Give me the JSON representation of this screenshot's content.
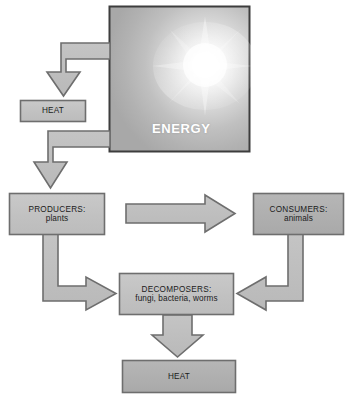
{
  "diagram": {
    "background_color": "#ffffff",
    "stroke_color": "#6b6b6b",
    "box_fill_light": "#c2c2c2",
    "box_fill_dark": "#b0b0b0",
    "arrow_fill": "#bebebe",
    "energy_text_color": "#ffffff"
  },
  "nodes": {
    "energy": {
      "label": "ENERGY",
      "fill": "radial-gradient-sun",
      "x": 109,
      "y": 6,
      "w": 141,
      "h": 146
    },
    "heat_top": {
      "label": "HEAT",
      "x": 20,
      "y": 100,
      "w": 66,
      "h": 22
    },
    "producers": {
      "label": "PRODUCERS:",
      "sublabel": "plants",
      "x": 9,
      "y": 193,
      "w": 96,
      "h": 42
    },
    "consumers": {
      "label": "CONSUMERS:",
      "sublabel": "animals",
      "x": 253,
      "y": 193,
      "w": 91,
      "h": 42
    },
    "decomposers": {
      "label": "DECOMPOSERS:",
      "sublabel": "fungi, bacteria, worms",
      "x": 119,
      "y": 273,
      "w": 115,
      "h": 42
    },
    "heat_bottom": {
      "label": "HEAT",
      "x": 122,
      "y": 360,
      "w": 114,
      "h": 33
    }
  },
  "arrows": [
    {
      "name": "energy-to-heat-top",
      "kind": "elbow-left-down",
      "from": "energy",
      "to": "heat_top"
    },
    {
      "name": "energy-to-producers",
      "kind": "elbow-left-down",
      "from": "energy",
      "to": "producers"
    },
    {
      "name": "producers-to-consumers",
      "kind": "straight-right",
      "from": "producers",
      "to": "consumers"
    },
    {
      "name": "producers-to-decomposers",
      "kind": "elbow-down-right",
      "from": "producers",
      "to": "decomposers"
    },
    {
      "name": "consumers-to-decomposers",
      "kind": "elbow-down-left",
      "from": "consumers",
      "to": "decomposers"
    },
    {
      "name": "decomposers-to-heat",
      "kind": "straight-down",
      "from": "decomposers",
      "to": "heat_bottom"
    }
  ]
}
